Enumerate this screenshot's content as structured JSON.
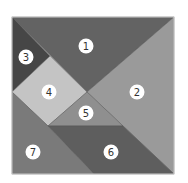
{
  "diagram": {
    "type": "tangram",
    "outer_square": {
      "x": 12,
      "y": 17,
      "width": 162,
      "height": 157,
      "border_color": "#d0d0d0"
    },
    "label_circle": {
      "radius": 7.5,
      "fill": "#ffffff"
    },
    "pieces": [
      {
        "id": "1",
        "label": "1",
        "shape": "large-triangle",
        "color": "#636363",
        "points": "12,17 174,17 87,92",
        "label_pos": [
          86,
          46
        ]
      },
      {
        "id": "2",
        "label": "2",
        "shape": "large-triangle",
        "color": "#9a9a9a",
        "points": "174,17 174,174 87,92",
        "label_pos": [
          137,
          92
        ]
      },
      {
        "id": "3",
        "label": "3",
        "shape": "small-triangle",
        "color": "#464646",
        "points": "12,17 50,56 12,92",
        "label_pos": [
          26,
          57
        ]
      },
      {
        "id": "4",
        "label": "4",
        "shape": "square",
        "color": "#c4c4c4",
        "points": "50,56 87,92 48,126 12,92",
        "label_pos": [
          49,
          92
        ]
      },
      {
        "id": "5",
        "label": "5",
        "shape": "small-triangle",
        "color": "#8f8f8f",
        "points": "87,92 123,126 48,126",
        "label_pos": [
          86,
          113
        ]
      },
      {
        "id": "6",
        "label": "6",
        "shape": "parallelogram",
        "color": "#5e5e5e",
        "points": "48,126 123,126 174,174 94,174",
        "label_pos": [
          111,
          152
        ]
      },
      {
        "id": "7",
        "label": "7",
        "shape": "medium-triangle",
        "color": "#7a7a7a",
        "points": "12,92 48,126 94,174 12,174",
        "label_pos": [
          33,
          152
        ]
      }
    ]
  }
}
